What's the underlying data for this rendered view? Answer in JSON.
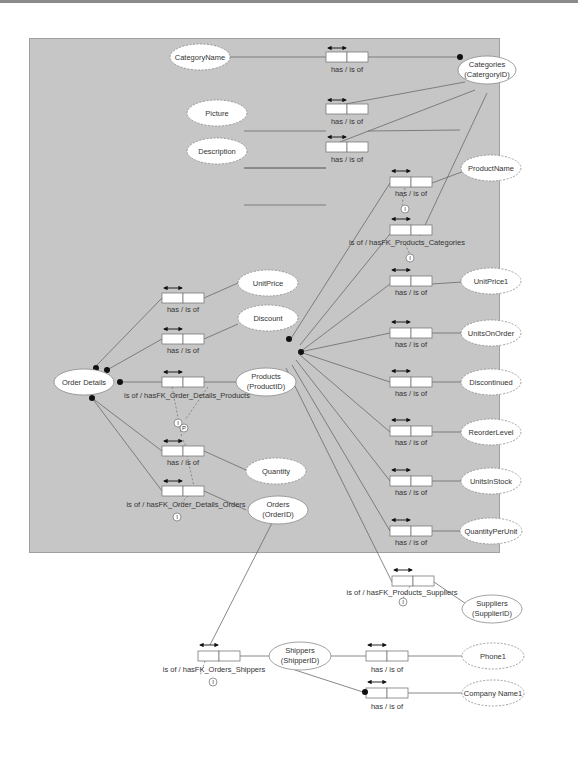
{
  "diagram": {
    "type": "ORM conceptual schema",
    "entities": {
      "categories": {
        "name": "Categories",
        "id": "(CatergoryID)"
      },
      "products": {
        "name": "Products",
        "id": "(ProductID)"
      },
      "order_details": {
        "name": "Order Details"
      },
      "orders": {
        "name": "Orders",
        "id": "(OrderID)"
      },
      "shippers": {
        "name": "Shippers",
        "id": "(ShipperID)"
      },
      "suppliers": {
        "name": "Suppliers",
        "id": "(SupplierID)"
      }
    },
    "values": {
      "category_name": "CategoryName",
      "picture": "Picture",
      "description": "Description",
      "product_name": "ProductName",
      "unit_price1": "UnitPrice1",
      "units_on_order": "UnitsOnOrder",
      "discontinued": "Discontinued",
      "reorder_level": "ReorderLevel",
      "units_in_stock": "UnitsInStock",
      "quantity_per_unit": "QuantityPerUnit",
      "unit_price": "UnitPrice",
      "discount": "Discount",
      "quantity": "Quantity",
      "phone1": "Phone1",
      "company_name1": "Company Name1"
    },
    "readings": {
      "has_is_of": "has / is of",
      "fk_products_categories": "is of / hasFK_Products_Categories",
      "fk_order_details_products": "is of / hasFK_Order_Details_Products",
      "fk_order_details_orders": "is of / hasFK_Order_Details_Orders",
      "fk_products_suppliers": "is of / hasFK_Products_Suppliers",
      "fk_orders_shippers": "is of / hasFK_Orders_Shippers"
    },
    "constraints": {
      "inclusive_or": "I",
      "primary": "P"
    }
  }
}
